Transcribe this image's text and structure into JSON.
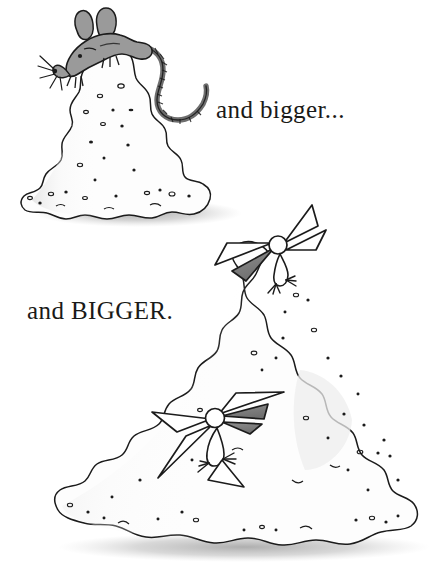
{
  "page": {
    "background_color": "#ffffff",
    "width": 442,
    "height": 582,
    "kind": "illustration-page"
  },
  "captions": [
    {
      "id": "caption-bigger",
      "text": "and bigger...",
      "color": "#1a1a18"
    },
    {
      "id": "caption-BIGGER",
      "text": "and BIGGER.",
      "color": "#1a1a18"
    }
  ],
  "illustration": {
    "palette": {
      "ink": "#1b1b1b",
      "mouse_body": "#9a9a9a",
      "mouse_tail": "#6e6e6e",
      "bird_wing": "#808080",
      "mound_fill": "#fdfdfd",
      "mound_shade": "#ececec",
      "ground_shadow": "#b5b5b5"
    },
    "scenes": [
      {
        "name": "small-mound-scene",
        "mound": "small-sand-mound",
        "animal": "mouse",
        "animal_details": {
          "ears": 2,
          "whiskers": 5,
          "tail": "long-curved-striped-tail"
        }
      },
      {
        "name": "large-mound-scene",
        "mound": "large-sand-mound",
        "animals": [
          "bird-on-peak",
          "bird-on-slope"
        ],
        "animal_details": {
          "wings": "angular-pointed",
          "head": "round-white",
          "feet": "splayed-three-toe"
        }
      }
    ]
  }
}
